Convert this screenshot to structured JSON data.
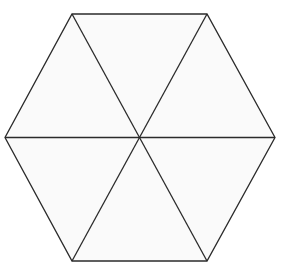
{
  "figure": {
    "name": "regular-hexagon-divided-into-six-triangles",
    "shape": "hexagon",
    "background_color": "#ffffff",
    "fill_color": "#fafafa",
    "stroke_color": "#2b2b2b",
    "stroke_width": 1.3,
    "canvas": {
      "width": 285,
      "height": 274
    },
    "center": {
      "x": 140,
      "y": 137.5
    },
    "vertices": [
      {
        "label": "top-left",
        "x": 72,
        "y": 14
      },
      {
        "label": "top-right",
        "x": 207,
        "y": 14
      },
      {
        "label": "right",
        "x": 275,
        "y": 137.5
      },
      {
        "label": "bottom-right",
        "x": 207,
        "y": 261
      },
      {
        "label": "bottom-left",
        "x": 72,
        "y": 261
      },
      {
        "label": "left",
        "x": 5,
        "y": 137.5
      }
    ],
    "outline_points": "72,14 207,14 275,137.5 207,261 72,261 5,137.5",
    "diagonals": [
      {
        "name": "horizontal-diagonal",
        "from": "left",
        "to": "right",
        "x1": 5,
        "y1": 137.5,
        "x2": 275,
        "y2": 137.5
      },
      {
        "name": "top-left-to-bottom-right-diagonal",
        "from": "top-left",
        "to": "bottom-right",
        "x1": 72,
        "y1": 14,
        "x2": 207,
        "y2": 261
      },
      {
        "name": "top-right-to-bottom-left-diagonal",
        "from": "top-right",
        "to": "bottom-left",
        "x1": 207,
        "y1": 14,
        "x2": 72,
        "y2": 261
      }
    ],
    "triangles": [
      {
        "name": "triangle-top",
        "points": "72,14 207,14 140,137.5"
      },
      {
        "name": "triangle-upper-right",
        "points": "207,14 275,137.5 140,137.5"
      },
      {
        "name": "triangle-lower-right",
        "points": "275,137.5 207,261 140,137.5"
      },
      {
        "name": "triangle-bottom",
        "points": "207,261 72,261 140,137.5"
      },
      {
        "name": "triangle-lower-left",
        "points": "72,261 5,137.5 140,137.5"
      },
      {
        "name": "triangle-upper-left",
        "points": "5,137.5 72,14 140,137.5"
      }
    ]
  }
}
